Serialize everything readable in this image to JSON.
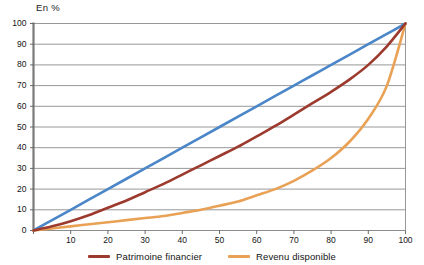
{
  "chart_data": {
    "type": "line",
    "title": "",
    "subtitle": "",
    "unit_label": "En %",
    "xlabel": "",
    "ylabel": "",
    "xlim": [
      0,
      100
    ],
    "ylim": [
      0,
      100
    ],
    "x_ticks": [
      0,
      10,
      20,
      30,
      40,
      50,
      60,
      70,
      80,
      90,
      100
    ],
    "y_ticks": [
      0,
      10,
      20,
      30,
      40,
      50,
      60,
      70,
      80,
      90,
      100
    ],
    "x_tick_labels": [
      "0",
      "10",
      "20",
      "30",
      "40",
      "50",
      "60",
      "70",
      "80",
      "90",
      "100"
    ],
    "y_tick_labels": [
      "0",
      "10",
      "20",
      "30",
      "40",
      "50",
      "60",
      "70",
      "80",
      "90",
      "100"
    ],
    "grid": {
      "horizontal": true,
      "vertical": false,
      "color": "#8c8c8c"
    },
    "legend_position": "bottom",
    "x": [
      0,
      5,
      10,
      15,
      20,
      25,
      30,
      35,
      40,
      45,
      50,
      55,
      60,
      65,
      70,
      75,
      80,
      85,
      90,
      95,
      100
    ],
    "series": [
      {
        "name": "Ligne d'egalite",
        "label": "",
        "color": "#4a86c8",
        "in_legend": false,
        "values": [
          0,
          5,
          10,
          15,
          20,
          25,
          30,
          35,
          40,
          45,
          50,
          55,
          60,
          65,
          70,
          75,
          80,
          85,
          90,
          95,
          100
        ]
      },
      {
        "name": "Revenu disponible",
        "label": "Revenu disponible",
        "color": "#e8a155",
        "in_legend": true,
        "values": [
          0,
          1,
          2,
          3,
          4,
          5,
          6,
          7,
          8.5,
          10,
          12,
          14,
          17,
          20,
          24,
          29,
          35,
          43,
          54,
          70,
          100
        ]
      },
      {
        "name": "Patrimoine financier",
        "label": "Patrimoine financier",
        "color": "#9c3a2e",
        "in_legend": true,
        "values": [
          0,
          2,
          4.5,
          7.5,
          11,
          14.5,
          18.5,
          22.5,
          27,
          31.5,
          36,
          40.5,
          45.5,
          50.5,
          56,
          61.5,
          67,
          73,
          80,
          89,
          100
        ]
      }
    ]
  },
  "legend": {
    "entries": [
      {
        "label": "Patrimoine financier",
        "color": "#9c3a2e",
        "swatch_name": "legend-swatch-patrimoine"
      },
      {
        "label": "Revenu disponible",
        "color": "#e8a155",
        "swatch_name": "legend-swatch-revenu"
      }
    ]
  }
}
